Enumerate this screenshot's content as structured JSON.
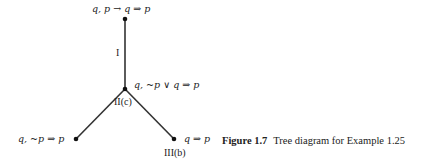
{
  "diagram": {
    "type": "tree",
    "nodes": [
      {
        "id": "root",
        "label": "q, p → q ⇒ p",
        "x": 125,
        "y": 19
      },
      {
        "id": "branch",
        "label": "q, ~p ∨ q ⇒ p",
        "x": 125,
        "y": 89
      },
      {
        "id": "left-leaf",
        "label": "q, ~p ⇒ p",
        "x": 76,
        "y": 139
      },
      {
        "id": "right-leaf",
        "label": "q ⇒ p",
        "x": 174,
        "y": 139
      }
    ],
    "edges": [
      {
        "from": "root",
        "to": "branch",
        "label": "I"
      },
      {
        "from": "branch",
        "to": "left-leaf",
        "label": ""
      },
      {
        "from": "branch",
        "to": "right-leaf",
        "label": ""
      }
    ],
    "rule_labels": {
      "trunk": "I",
      "branch": "II(c)",
      "right_leaf": "III(b)"
    }
  },
  "caption": {
    "figure_number": "Figure 1.7",
    "text": "Tree diagram for Example 1.25"
  }
}
